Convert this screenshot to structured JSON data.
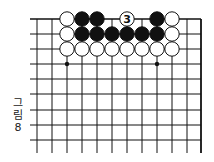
{
  "diagram": {
    "caption_line1": "그",
    "caption_line2": "림",
    "caption_line3": "8",
    "grid": {
      "x": [
        37,
        52,
        67,
        82,
        97,
        112,
        127,
        142,
        157,
        172,
        187,
        201
      ],
      "y": [
        19,
        34,
        49,
        64,
        79,
        94,
        110,
        125,
        140
      ],
      "right_edge": true,
      "top_edge": true
    },
    "hoshi": [
      [
        67,
        64
      ],
      [
        157,
        64
      ]
    ],
    "stones": [
      {
        "color": "white",
        "x": 67,
        "y": 19
      },
      {
        "color": "black",
        "x": 82,
        "y": 19
      },
      {
        "color": "black",
        "x": 97,
        "y": 19
      },
      {
        "color": "white",
        "x": 127,
        "y": 19,
        "label": "3"
      },
      {
        "color": "black",
        "x": 157,
        "y": 19
      },
      {
        "color": "white",
        "x": 172,
        "y": 19
      },
      {
        "color": "white",
        "x": 67,
        "y": 34
      },
      {
        "color": "black",
        "x": 82,
        "y": 34
      },
      {
        "color": "black",
        "x": 97,
        "y": 34
      },
      {
        "color": "black",
        "x": 112,
        "y": 34
      },
      {
        "color": "black",
        "x": 127,
        "y": 34
      },
      {
        "color": "black",
        "x": 142,
        "y": 34
      },
      {
        "color": "black",
        "x": 157,
        "y": 34
      },
      {
        "color": "white",
        "x": 172,
        "y": 34
      },
      {
        "color": "white",
        "x": 67,
        "y": 49
      },
      {
        "color": "white",
        "x": 82,
        "y": 49
      },
      {
        "color": "white",
        "x": 97,
        "y": 49
      },
      {
        "color": "white",
        "x": 112,
        "y": 49
      },
      {
        "color": "white",
        "x": 127,
        "y": 49
      },
      {
        "color": "white",
        "x": 142,
        "y": 49
      },
      {
        "color": "white",
        "x": 157,
        "y": 49
      },
      {
        "color": "white",
        "x": 172,
        "y": 49
      }
    ]
  }
}
